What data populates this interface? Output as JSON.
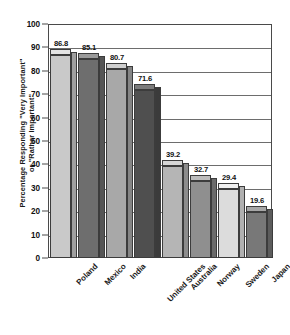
{
  "chart_data": {
    "type": "bar",
    "title": "",
    "xlabel": "",
    "ylabel": "Percentage Responding \"Very Important\"\nor \"Rather Important\"",
    "ylim": [
      0,
      100
    ],
    "yticks": [
      0,
      10,
      20,
      30,
      40,
      50,
      60,
      70,
      80,
      90,
      100
    ],
    "grid": true,
    "legend": "none",
    "categories": [
      "Poland",
      "Mexico",
      "India",
      "United States",
      "Australia",
      "Norway",
      "Sweden",
      "Japan"
    ],
    "values": [
      86.8,
      85.1,
      80.7,
      71.6,
      39.2,
      32.7,
      29.4,
      19.6
    ],
    "value_labels": [
      "86.8",
      "85.1",
      "80.7",
      "71.6",
      "39.2",
      "32.7",
      "29.4",
      "19.6"
    ],
    "bar_colors": [
      "#c9c9c9",
      "#6e6e6e",
      "#a8a8a8",
      "#4f4f4f",
      "#b5b5b5",
      "#8f8f8f",
      "#dcdcdc",
      "#787878"
    ],
    "bar_top_colors": [
      "#e4e4e4",
      "#9a9a9a",
      "#cfcfcf",
      "#7b7b7b",
      "#d6d6d6",
      "#bcbcbc",
      "#f0f0f0",
      "#a6a6a6"
    ],
    "bar_side_colors": [
      "#9f9f9f",
      "#555555",
      "#858585",
      "#3b3b3b",
      "#8c8c8c",
      "#6b6b6b",
      "#b0b0b0",
      "#5c5c5c"
    ],
    "axis_color": "#4a4a4a",
    "grid_color": "#6d6d6d"
  }
}
